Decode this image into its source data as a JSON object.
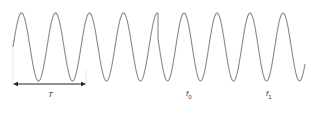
{
  "diagram": {
    "title": "",
    "labels": {
      "period": "T",
      "f0_base": "f",
      "f0_sub": "0",
      "f1_base": "f",
      "f1_sub": "1"
    },
    "colors": {
      "wave": "#8a8a8a",
      "arrow": "#222222",
      "guide": "#d8d8d8"
    },
    "waveform": {
      "midline_y": 47,
      "amplitude": 34,
      "segments": [
        {
          "name": "segment-1",
          "x_start": 13,
          "x_end": 158,
          "period_px": 34,
          "phase_start": 0
        },
        {
          "name": "segment-2",
          "x_start": 158,
          "x_end": 305,
          "period_px": 33,
          "phase_start": 2.9
        }
      ]
    },
    "period_marker": {
      "x_start": 13,
      "x_end": 86,
      "y": 84,
      "label_x": 48,
      "label_y": 90
    },
    "frequency_labels": [
      {
        "id": "f0",
        "x": 186,
        "y": 89
      },
      {
        "id": "f1",
        "x": 266,
        "y": 89
      }
    ]
  }
}
